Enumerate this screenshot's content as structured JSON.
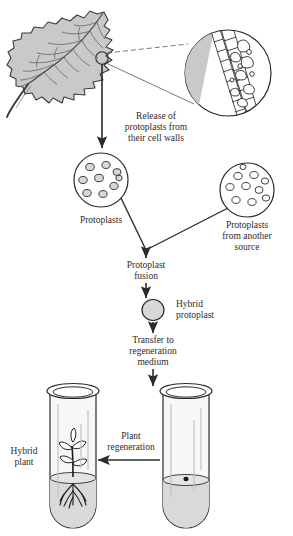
{
  "figure": {
    "background_color": "#ffffff",
    "ink_color": "#2b2b2b",
    "leaf_fill": "#c9c9c9",
    "protoplast_fill": "#d8d8d8",
    "medium_fill": "#d9d9d9",
    "glass_fill": "#f2f2f2"
  },
  "steps": {
    "release": {
      "line1": "Release of",
      "line2": "protoplasts from",
      "line3": "their cell walls"
    },
    "protoplasts_left": {
      "label": "Protoplasts"
    },
    "protoplasts_right": {
      "line1": "Protoplasts",
      "line2": "from another",
      "line3": "source"
    },
    "fusion": {
      "line1": "Protoplast",
      "line2": "fusion"
    },
    "hybrid_protoplast": {
      "line1": "Hybrid",
      "line2": "protoplast"
    },
    "transfer": {
      "line1": "Transfer to",
      "line2": "regeneration",
      "line3": "medium"
    },
    "regeneration": {
      "line1": "Plant",
      "line2": "regeneration"
    },
    "hybrid_plant": {
      "line1": "Hybrid",
      "line2": "plant"
    }
  },
  "counts": {
    "protoplasts_left": 9,
    "protoplasts_right": 10,
    "plantlet_leaves": 5
  }
}
